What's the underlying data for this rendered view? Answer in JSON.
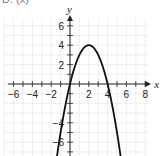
{
  "header": {
    "label": "D. (x)"
  },
  "chart_data": {
    "type": "line",
    "title": "",
    "xlabel": "x",
    "ylabel": "y",
    "xlim": [
      -7,
      8.5
    ],
    "ylim": [
      -7,
      7
    ],
    "grid": true,
    "x_tick_labels": [
      "-6",
      "-4",
      "-2",
      "2",
      "4",
      "6",
      "8"
    ],
    "y_tick_labels": [
      "6",
      "4",
      "2",
      "-4",
      "-6"
    ],
    "series": [
      {
        "name": "parabola",
        "equation": "y = -(x - 2)^2 + 4",
        "vertex": [
          2,
          4
        ],
        "x_intercepts": [
          0,
          4
        ],
        "y_intercept": 0,
        "x": [
          -1,
          0,
          1,
          2,
          3,
          4,
          5
        ],
        "values": [
          -5,
          0,
          3,
          4,
          3,
          0,
          -5
        ]
      }
    ]
  }
}
